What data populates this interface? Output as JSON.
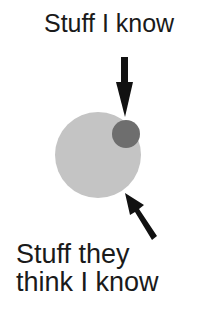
{
  "diagram": {
    "top_label": "Stuff I know",
    "bottom_label": "Stuff they\nthink I know",
    "shapes": {
      "large_circle": {
        "meaning": "Stuff they think I know",
        "color": "#c4c4c4"
      },
      "small_circle": {
        "meaning": "Stuff I know",
        "color": "#6e6e6e"
      },
      "arrow_down": {
        "points_to": "small_circle",
        "color": "#111111"
      },
      "arrow_diagonal": {
        "points_to": "large_circle",
        "color": "#111111"
      }
    }
  }
}
